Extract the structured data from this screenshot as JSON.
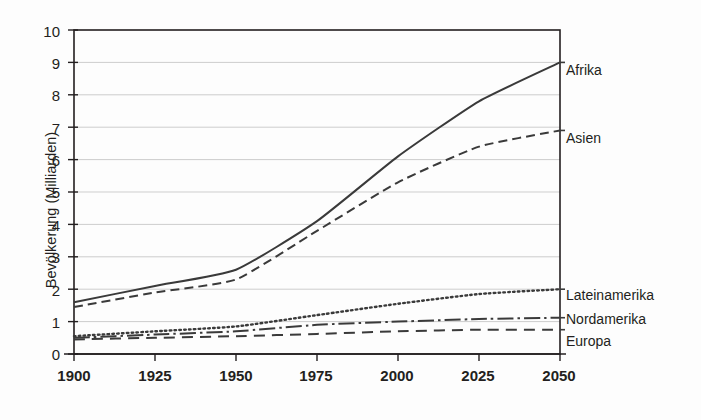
{
  "chart_data": {
    "type": "line",
    "title": "",
    "subtitle": "",
    "xlabel": "",
    "ylabel": "Bevölkerung (Milliarden)",
    "xlim": [
      1900,
      2050
    ],
    "ylim": [
      0,
      10
    ],
    "grid": true,
    "grid_axis": "y",
    "legend_position": "right-inline-labels",
    "x_ticks": [
      "1900",
      "1925",
      "1950",
      "1975",
      "2000",
      "2025",
      "2050"
    ],
    "x_tick_values": [
      1900,
      1925,
      1950,
      1975,
      2000,
      2025,
      2050
    ],
    "y_ticks": [
      "0",
      "1",
      "2",
      "3",
      "4",
      "5",
      "6",
      "7",
      "8",
      "9",
      "10"
    ],
    "y_tick_values": [
      0,
      1,
      2,
      3,
      4,
      5,
      6,
      7,
      8,
      9,
      10
    ],
    "x": [
      1900,
      1925,
      1950,
      1975,
      2000,
      2025,
      2050
    ],
    "series": [
      {
        "name": "Afrika",
        "style": "solid",
        "color": "#3a3a3a",
        "values": [
          1.6,
          2.1,
          2.6,
          4.1,
          6.1,
          7.8,
          9.0
        ]
      },
      {
        "name": "Asien",
        "style": "dashed",
        "color": "#3a3a3a",
        "values": [
          1.45,
          1.9,
          2.3,
          3.8,
          5.3,
          6.4,
          6.9
        ]
      },
      {
        "name": "Lateinamerika",
        "style": "dotted",
        "color": "#3a3a3a",
        "values": [
          0.55,
          0.7,
          0.85,
          1.2,
          1.55,
          1.85,
          2.0
        ]
      },
      {
        "name": "Nordamerika",
        "style": "dashdot",
        "color": "#3a3a3a",
        "values": [
          0.5,
          0.6,
          0.7,
          0.9,
          1.0,
          1.08,
          1.12
        ]
      },
      {
        "name": "Europa",
        "style": "dashed-long",
        "color": "#3a3a3a",
        "values": [
          0.45,
          0.5,
          0.55,
          0.62,
          0.7,
          0.75,
          0.75
        ]
      }
    ]
  },
  "axis": {
    "y_title": "Bevölkerung (Milliarden)",
    "y_tick_0": "0",
    "y_tick_1": "1",
    "y_tick_2": "2",
    "y_tick_3": "3",
    "y_tick_4": "4",
    "y_tick_5": "5",
    "y_tick_6": "6",
    "y_tick_7": "7",
    "y_tick_8": "8",
    "y_tick_9": "9",
    "y_tick_10": "10",
    "x_tick_1900": "1900",
    "x_tick_1925": "1925",
    "x_tick_1950": "1950",
    "x_tick_1975": "1975",
    "x_tick_2000": "2000",
    "x_tick_2025": "2025",
    "x_tick_2050": "2050"
  },
  "labels": {
    "afrika": "Afrika",
    "asien": "Asien",
    "lateinamerika": "Lateinamerika",
    "nordamerika": "Nordamerika",
    "europa": "Europa"
  },
  "colors": {
    "line": "#3a3a3a",
    "axis": "#231f20",
    "grid": "#b9b9b9",
    "background": "#fdfdfd",
    "text": "#231f20"
  }
}
